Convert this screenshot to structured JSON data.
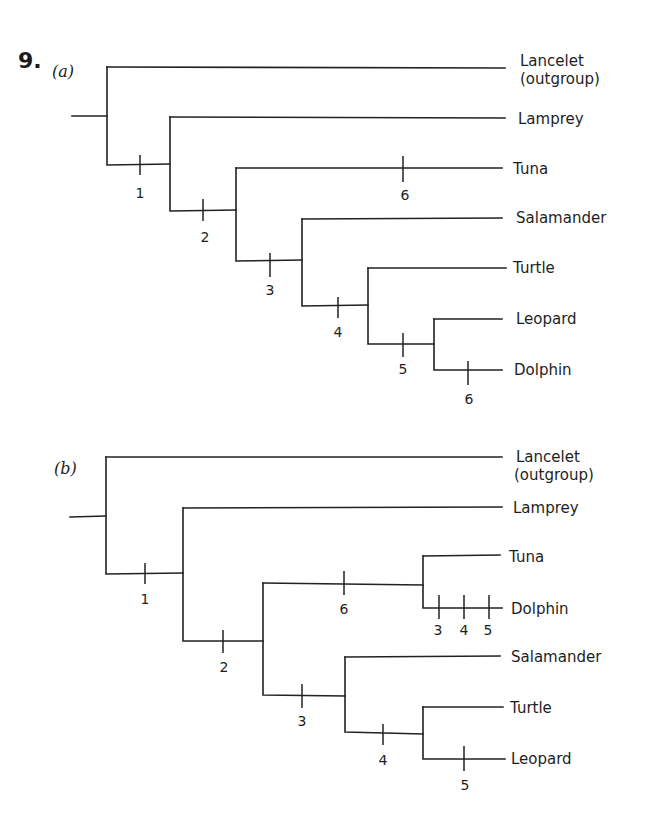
{
  "problem": {
    "number": "9."
  },
  "tree_a": {
    "label": "(a)",
    "taxa": [
      "Lancelet",
      "(outgroup)",
      "Lamprey",
      "Tuna",
      "Salamander",
      "Turtle",
      "Leopard",
      "Dolphin"
    ],
    "ticks": [
      "1",
      "2",
      "6",
      "3",
      "4",
      "5",
      "6"
    ]
  },
  "tree_b": {
    "label": "(b)",
    "taxa": [
      "Lancelet",
      "(outgroup)",
      "Lamprey",
      "Tuna",
      "Dolphin",
      "Salamander",
      "Turtle",
      "Leopard"
    ],
    "ticks": [
      "1",
      "2",
      "6",
      "3",
      "4",
      "5",
      "3",
      "4",
      "5"
    ]
  }
}
